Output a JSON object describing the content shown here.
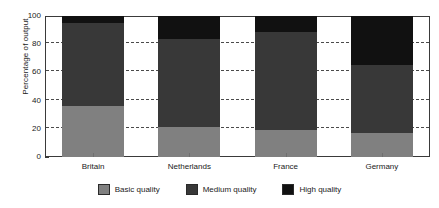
{
  "chart_data": {
    "type": "bar",
    "subtype": "stacked-bar",
    "title": "",
    "xlabel": "",
    "ylabel": "Percentage of output",
    "categories": [
      "Britain",
      "Netherlands",
      "France",
      "Germany"
    ],
    "series": [
      {
        "name": "Basic quality",
        "color": "#808080",
        "values": [
          36,
          21,
          19,
          17
        ]
      },
      {
        "name": "Medium quality",
        "color": "#383838",
        "values": [
          59,
          63,
          70,
          48
        ]
      },
      {
        "name": "High quality",
        "color": "#111111",
        "values": [
          5,
          16,
          11,
          35
        ]
      }
    ],
    "ylim": [
      0,
      100
    ],
    "yticks": [
      0,
      20,
      40,
      60,
      80,
      100
    ],
    "ytick_labels": [
      "0",
      "20",
      "40",
      "60",
      "80",
      "100"
    ],
    "yminor_ticks": [
      10,
      30,
      50,
      70,
      90
    ],
    "grid": true,
    "grid_style": "dashed",
    "legend_position": "bottom",
    "legend": [
      "Basic quality",
      "Medium quality",
      "High quality"
    ]
  }
}
